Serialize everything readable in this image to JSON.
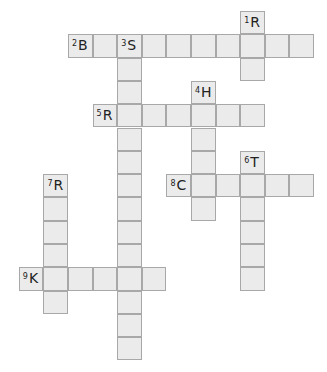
{
  "puzzle": {
    "type": "crossword",
    "origin_x": 68,
    "origin_y": 11,
    "cell_w": 24.6,
    "cell_h": 23.3,
    "colors": {
      "cell_fill": "#ebebeb",
      "cell_border": "#a8a8a8",
      "text": "#222222"
    },
    "words": [
      {
        "number": "1",
        "letter": "R",
        "dir": "down",
        "col": 7,
        "row": 0,
        "length": 3
      },
      {
        "number": "2",
        "letter": "B",
        "dir": "across",
        "col": 0,
        "row": 1,
        "length": 10
      },
      {
        "number": "3",
        "letter": "S",
        "dir": "down",
        "col": 2,
        "row": 1,
        "length": 14
      },
      {
        "number": "4",
        "letter": "H",
        "dir": "down",
        "col": 5,
        "row": 3,
        "length": 6
      },
      {
        "number": "5",
        "letter": "R",
        "dir": "across",
        "col": 1,
        "row": 4,
        "length": 7
      },
      {
        "number": "6",
        "letter": "T",
        "dir": "down",
        "col": 7,
        "row": 6,
        "length": 6
      },
      {
        "number": "7",
        "letter": "R",
        "dir": "down",
        "col": -1,
        "row": 7,
        "length": 6
      },
      {
        "number": "8",
        "letter": "C",
        "dir": "across",
        "col": 4,
        "row": 7,
        "length": 6
      },
      {
        "number": "9",
        "letter": "K",
        "dir": "across",
        "col": -2,
        "row": 11,
        "length": 6
      }
    ]
  }
}
